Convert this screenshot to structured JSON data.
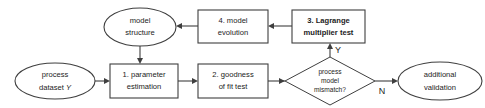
{
  "diagram": {
    "type": "flowchart",
    "colors": {
      "stroke": "#3f3f3f",
      "fill": "#ffffff",
      "text": "#1c1c1c",
      "background": "#ffffff"
    },
    "nodes": [
      {
        "id": "model-structure",
        "shape": "ellipse",
        "lines": [
          "model",
          "structure"
        ],
        "line1": "model",
        "line2": "structure",
        "bold": false,
        "cx": 140,
        "cy": 27,
        "rx": 36,
        "ry": 19
      },
      {
        "id": "model-evolution",
        "shape": "rectangle",
        "lines": [
          "4. model",
          "evolution"
        ],
        "line1": "4. model",
        "line2": "evolution",
        "bold": false,
        "x": 198,
        "y": 10,
        "w": 70,
        "h": 33
      },
      {
        "id": "lagrange-multiplier-test",
        "shape": "rectangle",
        "lines": [
          "3. Lagrange",
          "multiplier test"
        ],
        "line1": "3. Lagrange",
        "line2": "multiplier test",
        "bold": true,
        "x": 292,
        "y": 10,
        "w": 73,
        "h": 33
      },
      {
        "id": "process-dataset",
        "shape": "ellipse",
        "lines": [
          "process",
          "dataset Y"
        ],
        "line1": "process",
        "line2a": "dataset ",
        "line2b": "Y",
        "bold": false,
        "cx": 55,
        "cy": 81,
        "rx": 40,
        "ry": 18
      },
      {
        "id": "parameter-estimation",
        "shape": "rectangle",
        "lines": [
          "1. parameter",
          "estimation"
        ],
        "line1": "1. parameter",
        "line2": "estimation",
        "bold": false,
        "x": 110,
        "y": 64,
        "w": 68,
        "h": 34
      },
      {
        "id": "goodness-of-fit-test",
        "shape": "rectangle",
        "lines": [
          "2. goodness",
          "of fit test"
        ],
        "line1": "2. goodness",
        "line2": "of fit test",
        "bold": false,
        "x": 198,
        "y": 64,
        "w": 70,
        "h": 34
      },
      {
        "id": "process-model-mismatch",
        "shape": "diamond",
        "lines": [
          "process",
          "model",
          "mismatch?"
        ],
        "line1": "process",
        "line2": "model",
        "line3": "mismatch?",
        "bold": false,
        "cx": 330,
        "cy": 81,
        "rx": 45,
        "ry": 24
      },
      {
        "id": "additional-validation",
        "shape": "ellipse",
        "lines": [
          "additional",
          "validation"
        ],
        "line1": "additional",
        "line2": "validation",
        "bold": false,
        "cx": 440,
        "cy": 81,
        "rx": 42,
        "ry": 19
      }
    ],
    "edges": [
      {
        "id": "dataset-to-parameter",
        "from": "process-dataset",
        "to": "parameter-estimation",
        "label": "",
        "direction": "right"
      },
      {
        "id": "parameter-to-goodness",
        "from": "parameter-estimation",
        "to": "goodness-of-fit-test",
        "label": "",
        "direction": "right"
      },
      {
        "id": "goodness-to-mismatch",
        "from": "goodness-of-fit-test",
        "to": "process-model-mismatch",
        "label": "",
        "direction": "right"
      },
      {
        "id": "mismatch-to-validation",
        "from": "process-model-mismatch",
        "to": "additional-validation",
        "label": "N",
        "direction": "right"
      },
      {
        "id": "mismatch-to-lagrange",
        "from": "process-model-mismatch",
        "to": "lagrange-multiplier-test",
        "label": "Y",
        "direction": "up"
      },
      {
        "id": "lagrange-to-evolution",
        "from": "lagrange-multiplier-test",
        "to": "model-evolution",
        "label": "",
        "direction": "left"
      },
      {
        "id": "evolution-to-structure",
        "from": "model-evolution",
        "to": "model-structure",
        "label": "",
        "direction": "left"
      },
      {
        "id": "structure-to-parameter",
        "from": "model-structure",
        "to": "parameter-estimation",
        "label": "",
        "direction": "down"
      }
    ],
    "edge_labels": {
      "yes": "Y",
      "no": "N"
    }
  }
}
